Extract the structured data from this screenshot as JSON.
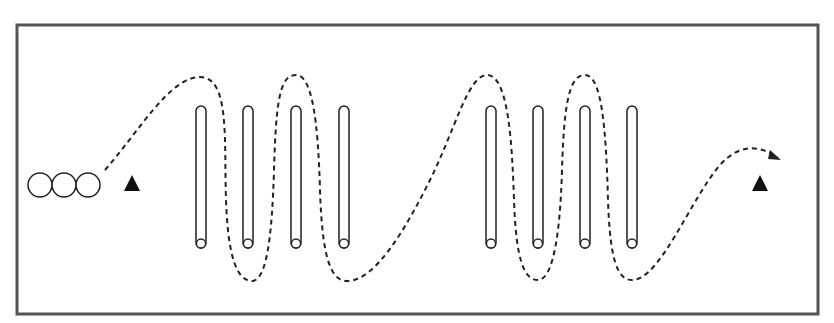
{
  "diagram": {
    "type": "slalom-drill",
    "colors": {
      "border": "#555555",
      "stroke": "#222222",
      "fill": "#111111",
      "background": "#ffffff"
    },
    "frame": {
      "x": 17,
      "y": 25,
      "width": 801,
      "height": 289
    },
    "start_circles": [
      {
        "x": 40,
        "y": 185,
        "r": 12
      },
      {
        "x": 64,
        "y": 185,
        "r": 12
      },
      {
        "x": 88,
        "y": 185,
        "r": 12
      }
    ],
    "cones": [
      {
        "x": 132,
        "y": 183,
        "size": 16
      },
      {
        "x": 760,
        "y": 183,
        "size": 16
      }
    ],
    "poles_left_group": [
      201,
      248,
      296,
      344
    ],
    "poles_right_group": [
      491,
      538,
      585,
      632
    ],
    "pole_top": 106,
    "pole_bottom": 248,
    "pole_width": 10,
    "path_d": "M105,170 C140,130 170,77 200,77 C230,77 224,140 226,200 C228,260 238,281 252,281 C266,281 272,240 274,170 C276,100 280,75 296,75 C312,75 318,120 320,190 C322,255 330,281 347,281 C375,281 405,230 430,180 C455,130 468,75 487,75 C508,75 512,140 514,200 C516,260 524,280 538,280 C552,280 560,240 562,170 C564,100 570,75 585,75 C602,75 606,130 608,200 C610,262 618,280 632,280 C660,280 690,200 720,165 C740,143 760,145 778,158"
  }
}
